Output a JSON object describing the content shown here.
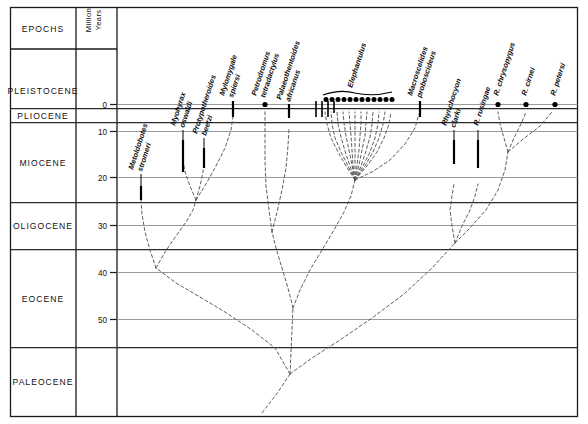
{
  "figure": {
    "domain": "diagram",
    "kind": "phylogenetic-tree-on-time-scale",
    "background": "#ffffff",
    "line_color": "#555555",
    "axis_color": "#1a1a1a"
  },
  "headers": {
    "epochs": "EPOCHS",
    "scale_line1": "Million",
    "scale_line2": "Years"
  },
  "epochs": [
    {
      "name": "PLEISTOCENE",
      "top_my": -9.0,
      "bottom_my": 1.8
    },
    {
      "name": "PLIOCENE",
      "top_my": 1.8,
      "bottom_my": 5.3
    },
    {
      "name": "MIOCENE",
      "top_my": 5.3,
      "bottom_my": 24.0
    },
    {
      "name": "OLIGOCENE",
      "top_my": 24.0,
      "bottom_my": 34.0
    },
    {
      "name": "EOCENE",
      "top_my": 34.0,
      "bottom_my": 55.0
    },
    {
      "name": "PALEOCENE",
      "top_my": 55.0,
      "bottom_my": 66.0
    }
  ],
  "axis": {
    "unit": "Million Years",
    "ticks": [
      0,
      10,
      20,
      30,
      40,
      50
    ],
    "tick_labels": [
      "0",
      "10",
      "20",
      "30",
      "40",
      "50"
    ],
    "min_my": 0,
    "max_my": 66
  },
  "taxa": [
    {
      "name": "Metoldobotes stromeri",
      "label_lines": [
        "Metoldobotes",
        "stromeri"
      ],
      "range_top_my": 29.0,
      "range_bottom_my": 33.5,
      "x": 141
    },
    {
      "name": "Myohyrax oswaldi",
      "label_lines": [
        "Myohyrax",
        "oswaldi"
      ],
      "range_top_my": 16.0,
      "range_bottom_my": 22.5,
      "x": 183
    },
    {
      "name": "Protypotheroides beetzi",
      "label_lines": [
        "Protypotheroides",
        "beetzi"
      ],
      "range_top_my": 19.0,
      "range_bottom_my": 22.0,
      "x": 204
    },
    {
      "name": "Mylomygale spiersi",
      "label_lines": [
        "Mylomygale",
        "spiersi"
      ],
      "range_top_my": -1.6,
      "range_bottom_my": 1.6,
      "x": 233
    },
    {
      "name": "Petrodromus tetradactylus",
      "label_lines": [
        "Petrodromus",
        "tetradactylus"
      ],
      "range_top_my": 0.0,
      "range_bottom_my": 0.0,
      "x": 265,
      "marker": "dot"
    },
    {
      "name": "Palaeothentoides africanus",
      "label_lines": [
        "Palaeothentoides",
        "africanus"
      ],
      "range_top_my": 1.3,
      "range_bottom_my": 3.6,
      "x": 289
    },
    {
      "name": "Elephantulus",
      "label_lines": [
        "Elephantulus"
      ],
      "range_top_my": -1.6,
      "range_bottom_my": 1.6,
      "x": 355,
      "group": true,
      "dots": 12
    },
    {
      "name": "Macroscelides proboscideus",
      "label_lines": [
        "Macroscelides",
        "proboscideus"
      ],
      "range_top_my": -1.6,
      "range_bottom_my": 1.6,
      "x": 420
    },
    {
      "name": "Rhynchocyon clarki",
      "label_lines": [
        "Rhynchocyon",
        "clarki"
      ],
      "range_top_my": 13.0,
      "range_bottom_my": 17.0,
      "x": 454
    },
    {
      "name": "R. rusingae",
      "label_lines": [
        "R. rusingae"
      ],
      "range_top_my": 13.0,
      "range_bottom_my": 18.0,
      "x": 478
    },
    {
      "name": "R. chrysopygus",
      "label_lines": [
        "R. chrysopygus"
      ],
      "range_top_my": 0.0,
      "range_bottom_my": 0.0,
      "x": 498,
      "marker": "dot"
    },
    {
      "name": "R. cirnei",
      "label_lines": [
        "R. cirnei"
      ],
      "range_top_my": 0.0,
      "range_bottom_my": 0.0,
      "x": 526,
      "marker": "dot"
    },
    {
      "name": "R. petersi",
      "label_lines": [
        "R. petersi"
      ],
      "range_top_my": 0.0,
      "range_bottom_my": 0.0,
      "x": 555,
      "marker": "dot"
    }
  ],
  "elephantulus_species_dots": 12,
  "notes": {
    "line_style": "dashed lineages, solid bars = known fossil ranges",
    "root_my": 62
  }
}
